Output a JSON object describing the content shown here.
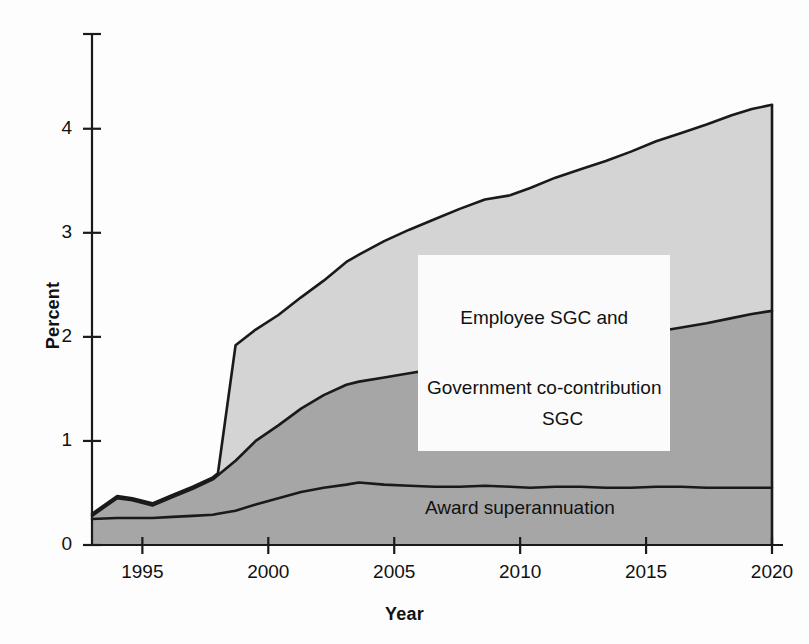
{
  "chart_data": {
    "type": "area",
    "stacked": true,
    "title": "",
    "subtitle": "",
    "xlabel": "Year",
    "ylabel": "Percent",
    "xlim": [
      1993,
      2020
    ],
    "ylim": [
      0,
      4.92
    ],
    "yticks": [
      0,
      1,
      2,
      3,
      4
    ],
    "ytick_labels": [
      "0",
      "1",
      "2",
      "3",
      "4"
    ],
    "xticks": [
      1995,
      2000,
      2005,
      2010,
      2015,
      2020
    ],
    "xtick_labels": [
      "1995",
      "2000",
      "2005",
      "2010",
      "2015",
      "2020"
    ],
    "grid": false,
    "legend_position": "in-plot-annotations",
    "colors": {
      "award_superannuation": "#a6a6a6",
      "sgc": "#a6a6a6",
      "employee_sgc_and_government_co_contribution": "#d4d4d4",
      "outline": "#1a1a1a",
      "axis": "#1a1a1a",
      "background": "#fdfdfd",
      "label_box": "#fbfbfb"
    },
    "x": [
      1993.0,
      1994.0,
      1994.6,
      1995.4,
      1996.2,
      1997.0,
      1997.8,
      1998.0,
      1998.7,
      1999.5,
      2000.4,
      2001.3,
      2002.2,
      2003.1,
      2003.6,
      2004.6,
      2005.6,
      2006.6,
      2007.6,
      2008.6,
      2009.6,
      2010.4,
      2011.4,
      2012.4,
      2013.4,
      2014.4,
      2015.4,
      2016.4,
      2017.4,
      2018.4,
      2019.2,
      2020.0
    ],
    "series": [
      {
        "name": "Award superannuation",
        "label": "Award superannuation",
        "fill": "#a6a6a6",
        "values": [
          0.25,
          0.26,
          0.26,
          0.26,
          0.27,
          0.28,
          0.29,
          0.3,
          0.33,
          0.39,
          0.45,
          0.51,
          0.55,
          0.58,
          0.6,
          0.58,
          0.57,
          0.56,
          0.56,
          0.57,
          0.56,
          0.55,
          0.56,
          0.56,
          0.55,
          0.55,
          0.56,
          0.56,
          0.55,
          0.55,
          0.55,
          0.55
        ]
      },
      {
        "name": "SGC",
        "label": "SGC",
        "fill": "#a6a6a6",
        "values": [
          0.03,
          0.19,
          0.17,
          0.12,
          0.19,
          0.26,
          0.34,
          0.37,
          0.48,
          0.61,
          0.7,
          0.8,
          0.89,
          0.96,
          0.97,
          1.03,
          1.08,
          1.13,
          1.18,
          1.22,
          1.26,
          1.26,
          1.31,
          1.35,
          1.39,
          1.44,
          1.49,
          1.53,
          1.58,
          1.63,
          1.67,
          1.7
        ]
      },
      {
        "name": "Employee SGC and Government co-contribution",
        "label": "Employee SGC and Government co-contribution",
        "fill": "#d4d4d4",
        "values": [
          0.02,
          0.02,
          0.02,
          0.02,
          0.02,
          0.02,
          0.02,
          0.02,
          1.11,
          1.07,
          1.06,
          1.07,
          1.1,
          1.18,
          1.22,
          1.31,
          1.38,
          1.44,
          1.49,
          1.53,
          1.54,
          1.62,
          1.66,
          1.7,
          1.75,
          1.79,
          1.83,
          1.87,
          1.91,
          1.95,
          1.97,
          1.98
        ]
      }
    ],
    "cumulative_top": {
      "award_superannuation": [
        0.25,
        0.26,
        0.26,
        0.26,
        0.27,
        0.28,
        0.29,
        0.3,
        0.33,
        0.39,
        0.45,
        0.51,
        0.55,
        0.58,
        0.6,
        0.58,
        0.57,
        0.56,
        0.56,
        0.57,
        0.56,
        0.55,
        0.56,
        0.56,
        0.55,
        0.55,
        0.56,
        0.56,
        0.55,
        0.55,
        0.55,
        0.55
      ],
      "plus_sgc": [
        0.28,
        0.45,
        0.43,
        0.38,
        0.46,
        0.54,
        0.63,
        0.67,
        0.81,
        1.0,
        1.15,
        1.31,
        1.44,
        1.54,
        1.57,
        1.61,
        1.65,
        1.69,
        1.74,
        1.79,
        1.82,
        1.81,
        1.87,
        1.91,
        1.94,
        1.99,
        2.05,
        2.09,
        2.13,
        2.18,
        2.22,
        2.25
      ],
      "total": [
        0.3,
        0.47,
        0.45,
        0.4,
        0.48,
        0.56,
        0.65,
        0.69,
        1.92,
        2.07,
        2.21,
        2.38,
        2.54,
        2.72,
        2.79,
        2.92,
        3.03,
        3.13,
        3.23,
        3.32,
        3.36,
        3.43,
        3.53,
        3.61,
        3.69,
        3.78,
        3.88,
        3.96,
        4.04,
        4.13,
        4.19,
        4.23
      ]
    },
    "annotations": [
      {
        "id": "top",
        "text": "Employee SGC and\nGovernment co-contribution",
        "boxed": true
      },
      {
        "id": "mid",
        "text": "SGC",
        "boxed": true
      },
      {
        "id": "bottom",
        "text": "Award superannuation",
        "boxed": false
      }
    ]
  },
  "axes": {
    "ylabel": "Percent",
    "xlabel": "Year",
    "ytick_labels": [
      "4",
      "3",
      "2",
      "1",
      "0"
    ],
    "xtick_labels": [
      "1995",
      "2000",
      "2005",
      "2010",
      "2015",
      "2020"
    ]
  },
  "annotations": {
    "top_line1": "Employee SGC and",
    "top_line2": "Government co-contribution",
    "mid": "SGC",
    "bottom": "Award superannuation"
  }
}
